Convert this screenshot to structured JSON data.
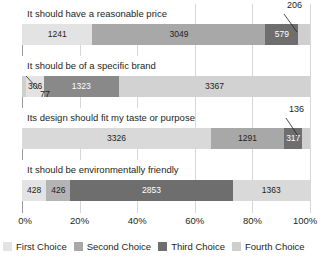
{
  "chart_data": {
    "type": "bar",
    "orientation": "horizontal",
    "stacked": true,
    "normalized": true,
    "title": "",
    "xlabel": "",
    "ylabel": "",
    "xlim": [
      0,
      100
    ],
    "xticks": [
      "0%",
      "20%",
      "40%",
      "60%",
      "80%",
      "100%"
    ],
    "xtick_values": [
      0,
      20,
      40,
      60,
      80,
      100
    ],
    "grid": true,
    "legend_position": "bottom",
    "legend": [
      "First Choice",
      "Second Choice",
      "Third Choice",
      "Fourth Choice"
    ],
    "colors": {
      "first": "#e3e3e3",
      "second": "#a8a8a8",
      "third": "#6e6e6e",
      "fourth": "#cfcfcf",
      "gridline": "#d7d7d7",
      "axis": "#9a9a9a",
      "text": "#231f20"
    },
    "categories": [
      "It should have a reasonable price",
      "It should be of a specific brand",
      "Its design should fit my taste or purpose",
      "It should be environmentally friendly"
    ],
    "series": [
      {
        "name": "First Choice",
        "values": [
          1241,
          306,
          3326,
          428
        ]
      },
      {
        "name": "Second Choice",
        "values": [
          3049,
          1323,
          1291,
          426
        ]
      },
      {
        "name": "Third Choice",
        "values": [
          579,
          3367,
          317,
          2853
        ]
      },
      {
        "name": "Fourth Choice",
        "values": [
          206,
          77,
          136,
          1363
        ]
      }
    ],
    "bars": [
      {
        "category": "It should have a reasonable price",
        "total": 5075,
        "segments": [
          {
            "series": "First Choice",
            "value": 1241,
            "label": "1241",
            "color": "#e3e3e3",
            "label_style": "dark",
            "pct": 24.45,
            "callout": false
          },
          {
            "series": "Second Choice",
            "value": 3049,
            "label": "3049",
            "color": "#a8a8a8",
            "label_style": "dark",
            "pct": 60.08,
            "callout": false
          },
          {
            "series": "Third Choice",
            "value": 579,
            "label": "579",
            "color": "#6e6e6e",
            "label_style": "light",
            "pct": 11.41,
            "callout": false
          },
          {
            "series": "Fourth Choice",
            "value": 206,
            "label": "206",
            "color": "#cfcfcf",
            "label_style": "callout",
            "pct": 4.06,
            "callout": true
          }
        ]
      },
      {
        "category": "It should be of a specific brand",
        "total": 5073,
        "segments": [
          {
            "series": "Fourth Choice",
            "value": 77,
            "label": "77",
            "color": "#cfcfcf",
            "label_style": "callout",
            "pct": 1.52,
            "callout": true
          },
          {
            "series": "First Choice",
            "value": 306,
            "label": "306",
            "color": "#e3e3e3",
            "label_style": "dark",
            "pct": 6.03,
            "callout": false
          },
          {
            "series": "Second Choice",
            "value": 1323,
            "label": "1323",
            "color": "#898989",
            "label_style": "light",
            "pct": 26.08,
            "callout": false
          },
          {
            "series": "Third Choice",
            "value": 3367,
            "label": "3367",
            "color": "#d2d2d2",
            "label_style": "dark",
            "pct": 66.37,
            "callout": false
          }
        ]
      },
      {
        "category": "Its design should fit my taste or purpose",
        "total": 5070,
        "segments": [
          {
            "series": "First Choice",
            "value": 3326,
            "label": "3326",
            "color": "#d9d9d9",
            "label_style": "dark",
            "pct": 65.6,
            "callout": false
          },
          {
            "series": "Second Choice",
            "value": 1291,
            "label": "1291",
            "color": "#a8a8a8",
            "label_style": "dark",
            "pct": 25.46,
            "callout": false
          },
          {
            "series": "Third Choice",
            "value": 317,
            "label": "317",
            "color": "#6e6e6e",
            "label_style": "light",
            "pct": 6.25,
            "callout": false
          },
          {
            "series": "Fourth Choice",
            "value": 136,
            "label": "136",
            "color": "#cfcfcf",
            "label_style": "callout",
            "pct": 2.68,
            "callout": true
          }
        ]
      },
      {
        "category": "It should be environmentally friendly",
        "total": 5070,
        "segments": [
          {
            "series": "First Choice",
            "value": 428,
            "label": "428",
            "color": "#e3e3e3",
            "label_style": "dark",
            "pct": 8.44,
            "callout": false
          },
          {
            "series": "Second Choice",
            "value": 426,
            "label": "426",
            "color": "#b4b4b4",
            "label_style": "dark",
            "pct": 8.4,
            "callout": false
          },
          {
            "series": "Third Choice",
            "value": 2853,
            "label": "2853",
            "color": "#6e6e6e",
            "label_style": "light",
            "pct": 56.27,
            "callout": false
          },
          {
            "series": "Fourth Choice",
            "value": 1363,
            "label": "1363",
            "color": "#d9d9d9",
            "label_style": "dark",
            "pct": 26.89,
            "callout": false
          }
        ]
      }
    ],
    "callouts": [
      {
        "label": "206",
        "bar": 0,
        "position": "top-right"
      },
      {
        "label": "77",
        "bar": 1,
        "position": "bottom-left"
      },
      {
        "label": "136",
        "bar": 2,
        "position": "top-right"
      }
    ]
  }
}
